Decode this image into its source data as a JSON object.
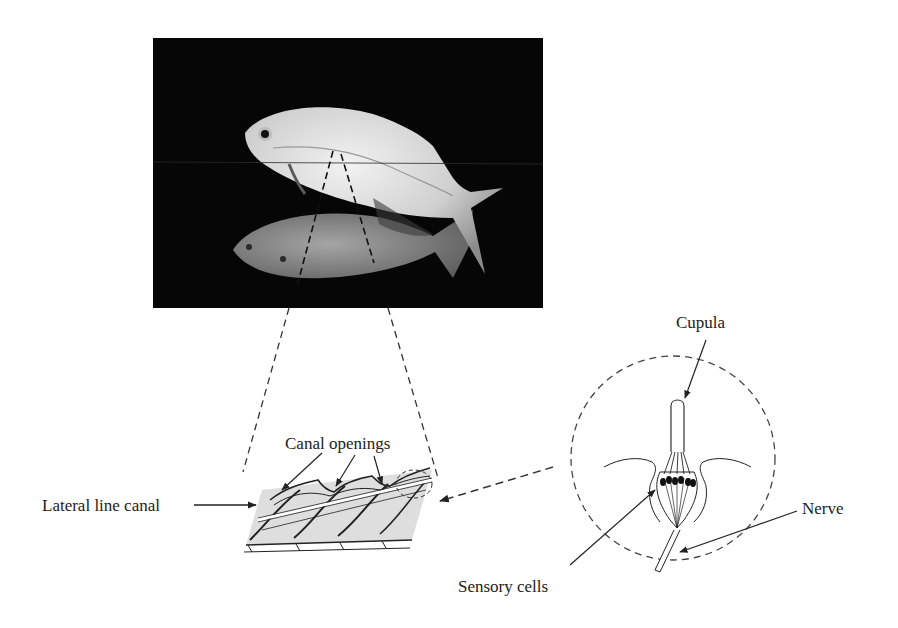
{
  "figure": {
    "photo": {
      "description": "Photograph of a silvery fish with its reflection on dark background",
      "background_color": "#060606"
    },
    "labels": {
      "lateral_line_canal": "Lateral line canal",
      "canal_openings": "Canal openings",
      "cupula": "Cupula",
      "sensory_cells": "Sensory cells",
      "nerve": "Nerve"
    },
    "colors": {
      "line": "#222222",
      "text": "#222222",
      "shading": "#d6d6d6",
      "fish_body": "#cfcfcf",
      "fish_reflection": "#8e8e8e"
    }
  }
}
